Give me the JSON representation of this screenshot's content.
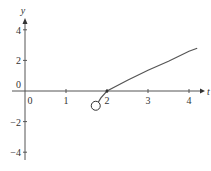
{
  "chart_data": {
    "type": "line",
    "title": "",
    "xlabel": "t",
    "ylabel": "y",
    "xlim": [
      -0.1,
      4.4
    ],
    "ylim": [
      -4.4,
      4.4
    ],
    "x_ticks": [
      0,
      1,
      2,
      3,
      4
    ],
    "y_ticks": [
      4,
      2,
      0,
      -2,
      -4
    ],
    "grid": false,
    "series": [
      {
        "name": "curve",
        "points": [
          [
            1.75,
            -0.9
          ],
          [
            1.85,
            -0.45
          ],
          [
            2.0,
            0.0
          ],
          [
            2.5,
            0.7
          ],
          [
            3.0,
            1.35
          ],
          [
            3.5,
            1.95
          ],
          [
            4.0,
            2.6
          ],
          [
            4.2,
            2.8
          ]
        ],
        "color": "#555555"
      }
    ],
    "annotations": [
      {
        "type": "open-circle",
        "x": 1.75,
        "y": -0.9
      }
    ]
  }
}
